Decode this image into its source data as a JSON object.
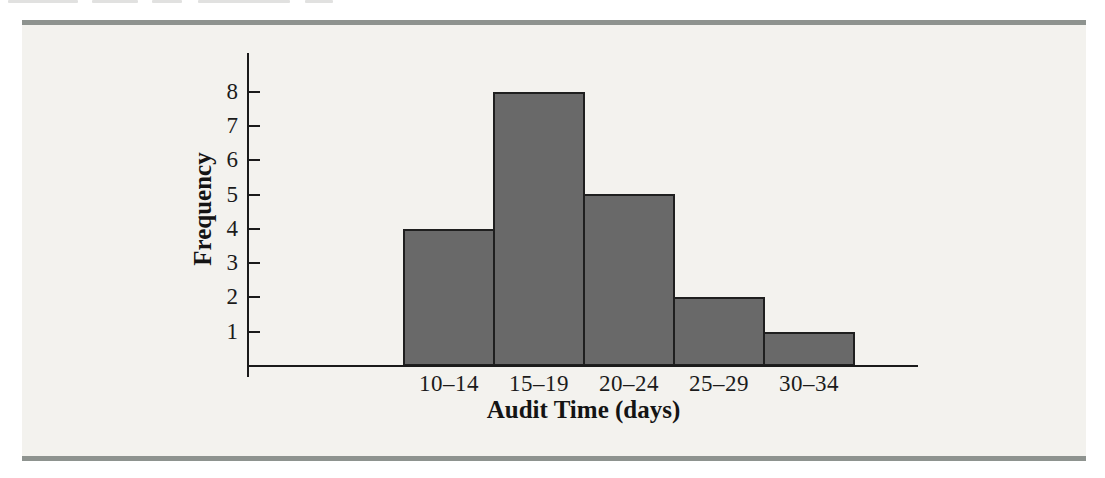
{
  "page": {
    "background": "#ffffff"
  },
  "figure_panel": {
    "background": "#f3f2ee",
    "rule_color": "#8e938f"
  },
  "chart_data": {
    "type": "bar",
    "categories": [
      "10–14",
      "15–19",
      "20–24",
      "25–29",
      "30–34"
    ],
    "values": [
      4,
      8,
      5,
      2,
      1
    ],
    "xlabel": "Audit Time (days)",
    "ylabel": "Frequency",
    "yticks": [
      1,
      2,
      3,
      4,
      5,
      6,
      7,
      8
    ],
    "ylim": [
      0,
      9.1
    ],
    "grid": false,
    "legend": false,
    "bar_color": "#696969",
    "bar_edge_color": "#1f1f1f",
    "axis_color": "#1a1a1a"
  }
}
